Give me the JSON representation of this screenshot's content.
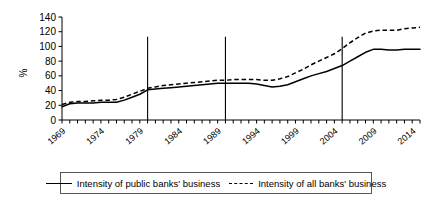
{
  "chart_data": {
    "type": "line",
    "title": "",
    "xlabel": "",
    "ylabel": "%",
    "ylim": [
      0,
      140
    ],
    "xlim": [
      1969,
      2015
    ],
    "ytick_labels": [
      "140",
      "120",
      "100",
      "80",
      "60",
      "40",
      "20",
      "0"
    ],
    "ytick_values": [
      140,
      120,
      100,
      80,
      60,
      40,
      20,
      0
    ],
    "xtick_labels": [
      "1969",
      "1974",
      "1979",
      "1984",
      "1989",
      "1994",
      "1999",
      "2004",
      "2009",
      "2014"
    ],
    "xtick_values": [
      1969,
      1974,
      1979,
      1984,
      1989,
      1994,
      1999,
      2004,
      2009,
      2014
    ],
    "grid": false,
    "legend_position": "bottom",
    "x": [
      1969,
      1970,
      1971,
      1972,
      1973,
      1974,
      1975,
      1976,
      1977,
      1978,
      1979,
      1980,
      1981,
      1982,
      1983,
      1984,
      1985,
      1986,
      1987,
      1988,
      1989,
      1990,
      1991,
      1992,
      1993,
      1994,
      1995,
      1996,
      1997,
      1998,
      1999,
      2000,
      2001,
      2002,
      2003,
      2004,
      2005,
      2006,
      2007,
      2008,
      2009,
      2010,
      2011,
      2012,
      2013,
      2014,
      2015
    ],
    "series": [
      {
        "name": "Intensity of public banks' business",
        "style": "solid",
        "values": [
          18,
          22,
          23,
          23,
          23,
          24,
          24,
          24,
          27,
          31,
          35,
          41,
          42,
          43,
          44,
          45,
          46,
          47,
          48,
          49,
          50,
          50,
          50,
          50,
          50,
          49,
          47,
          45,
          46,
          48,
          52,
          56,
          60,
          63,
          66,
          70,
          74,
          80,
          86,
          92,
          96,
          96,
          95,
          95,
          96,
          96,
          96
        ]
      },
      {
        "name": "Intensity of all banks' business",
        "style": "dashed",
        "values": [
          21,
          24,
          25,
          25,
          26,
          27,
          27,
          28,
          31,
          35,
          39,
          43,
          45,
          47,
          48,
          49,
          50,
          51,
          52,
          53,
          54,
          54,
          55,
          55,
          55,
          55,
          54,
          54,
          56,
          59,
          64,
          69,
          75,
          80,
          85,
          90,
          97,
          105,
          112,
          118,
          121,
          122,
          122,
          122,
          124,
          125,
          126
        ]
      }
    ],
    "annotations": [
      {
        "type": "vertical-line",
        "x": 1980,
        "y_top": 113,
        "y_bottom": 0
      },
      {
        "type": "vertical-line",
        "x": 1990,
        "y_top": 113,
        "y_bottom": 0
      },
      {
        "type": "vertical-line",
        "x": 2005,
        "y_top": 113,
        "y_bottom": 0
      }
    ]
  },
  "legend": {
    "items": [
      {
        "label": "Intensity of public banks' business",
        "style": "solid"
      },
      {
        "label": "Intensity of all banks' business",
        "style": "dashed"
      }
    ]
  },
  "axis": {
    "y_title": "%"
  },
  "colors": {
    "line": "#000000",
    "axis": "#000000",
    "background": "#ffffff",
    "legend_border": "#555555"
  }
}
